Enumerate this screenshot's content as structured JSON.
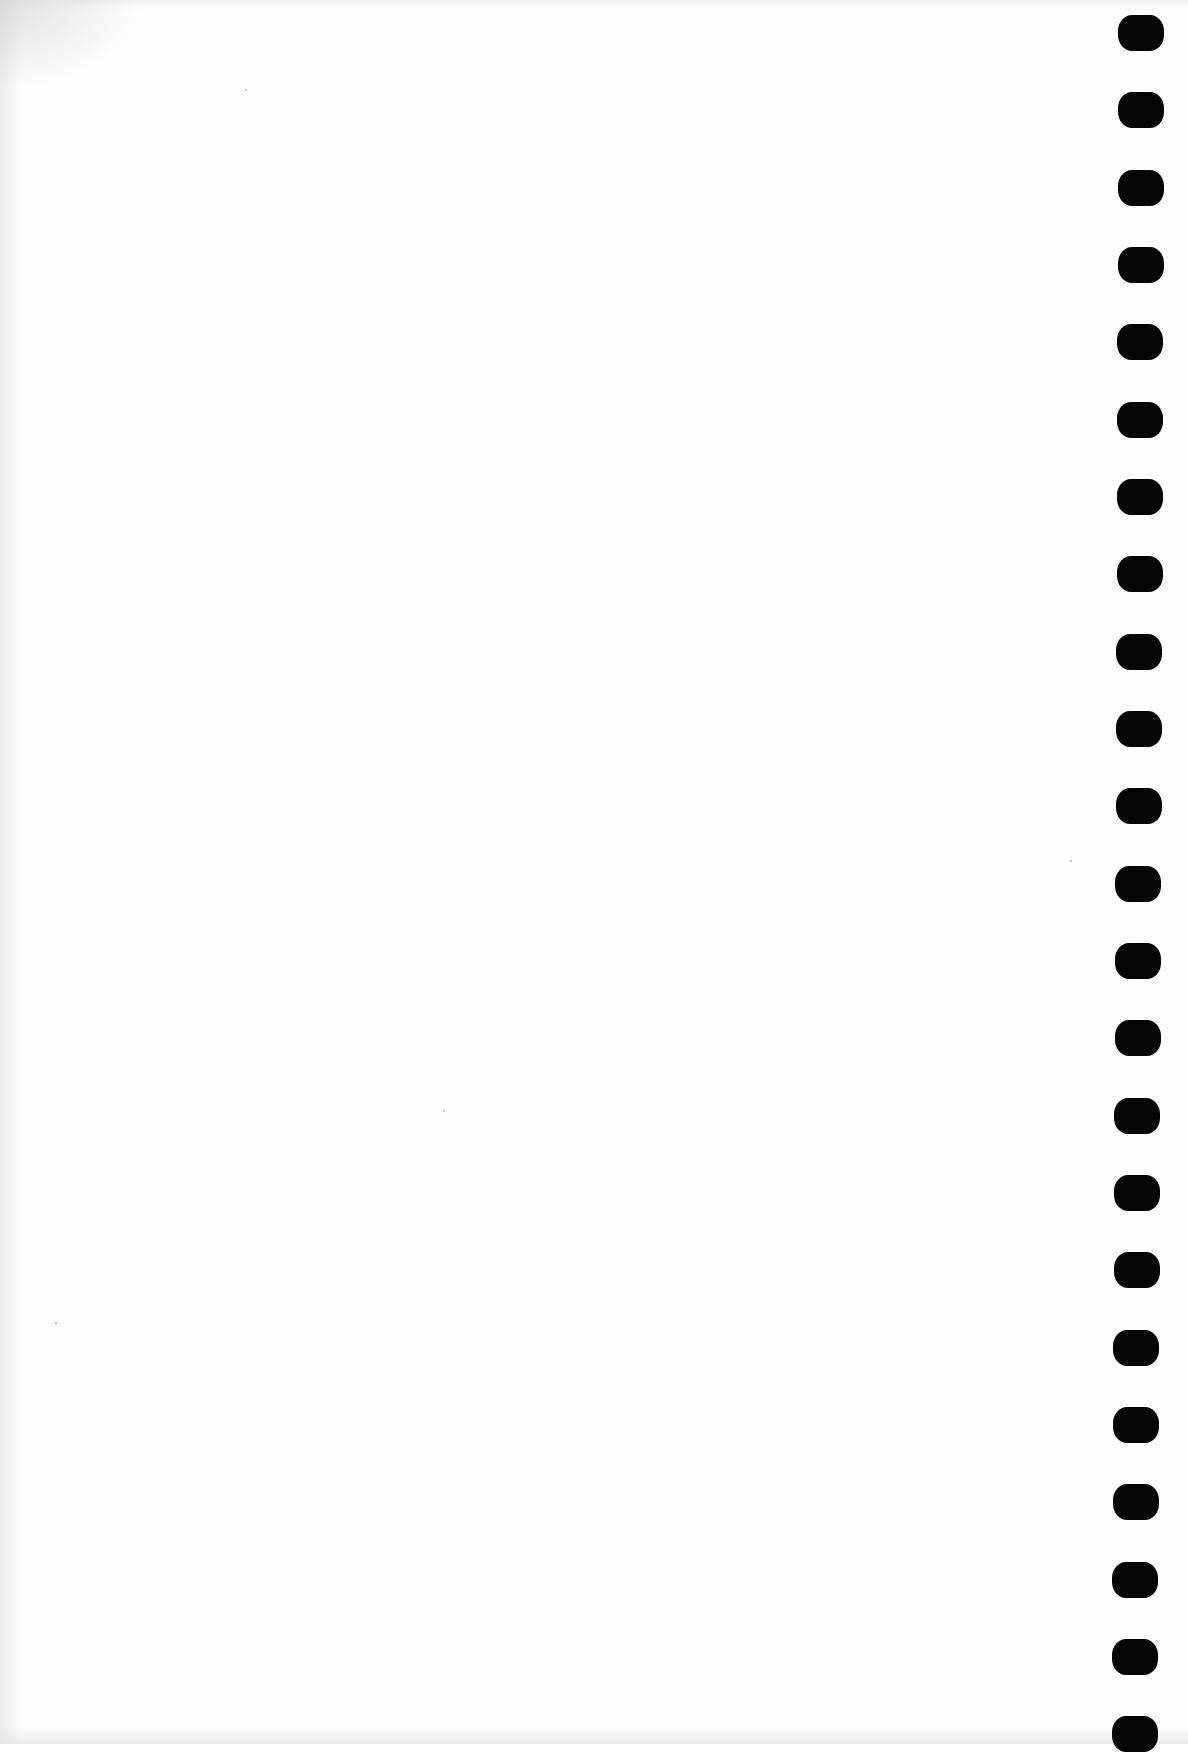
{
  "page": {
    "type": "blank scanned page",
    "background_color": "#ffffff",
    "binding": {
      "side": "right",
      "hole_count": 23,
      "hole_color": "#050505",
      "holes": [
        {
          "x": 1118,
          "y": 15
        },
        {
          "x": 1118,
          "y": 92
        },
        {
          "x": 1118,
          "y": 170
        },
        {
          "x": 1118,
          "y": 247
        },
        {
          "x": 1117,
          "y": 324
        },
        {
          "x": 1117,
          "y": 402
        },
        {
          "x": 1117,
          "y": 479
        },
        {
          "x": 1117,
          "y": 556
        },
        {
          "x": 1116,
          "y": 634
        },
        {
          "x": 1116,
          "y": 711
        },
        {
          "x": 1116,
          "y": 788
        },
        {
          "x": 1115,
          "y": 866
        },
        {
          "x": 1115,
          "y": 943
        },
        {
          "x": 1115,
          "y": 1020
        },
        {
          "x": 1114,
          "y": 1098
        },
        {
          "x": 1114,
          "y": 1175
        },
        {
          "x": 1114,
          "y": 1252
        },
        {
          "x": 1113,
          "y": 1330
        },
        {
          "x": 1113,
          "y": 1407
        },
        {
          "x": 1113,
          "y": 1484
        },
        {
          "x": 1112,
          "y": 1562
        },
        {
          "x": 1112,
          "y": 1639
        },
        {
          "x": 1112,
          "y": 1716
        }
      ]
    }
  }
}
